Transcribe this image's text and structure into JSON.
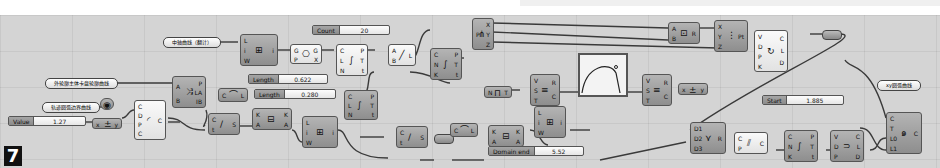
{
  "figure_number": "7",
  "panels": {
    "mid_curve": "中轴曲线（翻计）",
    "outer_curve": "外轮廓主体卡盘轮廓曲线",
    "boundary_curve": "轨迹圆弧边界曲线",
    "output_curve": "xy圆弧曲线"
  },
  "sliders": {
    "value": {
      "label": "Value",
      "value": "1.27"
    },
    "count": {
      "label": "Count",
      "value": "20"
    },
    "length1": {
      "label": "Length",
      "value": "0.622"
    },
    "length2": {
      "label": "Length",
      "value": "0.280"
    },
    "domain_end": {
      "label": "Domain end",
      "value": "5.52"
    },
    "start": {
      "label": "Start",
      "value": "1.885"
    }
  },
  "graph_mapper": {
    "label": "0.0.1",
    "corner": "0.0.1"
  },
  "nodes": [
    {
      "id": "merge",
      "inputs": [
        "C",
        "D",
        "P",
        "C"
      ],
      "outputs": [
        "C"
      ],
      "icon": "arc-icon"
    },
    {
      "id": "negate",
      "inputs": [
        "x"
      ],
      "outputs": [
        "y"
      ],
      "icon": "negate-icon"
    },
    {
      "id": "circle-param",
      "inputs": [],
      "outputs": [],
      "icon": "circle-icon"
    },
    {
      "id": "evaluate-angle",
      "inputs": [
        "A",
        "B"
      ],
      "outputs": [
        "P",
        "LA",
        "IB"
      ],
      "icon": "split-icon"
    },
    {
      "id": "shift-list",
      "inputs": [
        "L",
        "i",
        "W"
      ],
      "outputs": [
        "i"
      ],
      "icon": "list-item-icon"
    },
    {
      "id": "curve-closest",
      "inputs": [
        "G",
        "P"
      ],
      "outputs": [
        "G",
        "X"
      ],
      "icon": "geometry-icon"
    },
    {
      "id": "divide-curve-1",
      "inputs": [
        "C",
        "L",
        "N"
      ],
      "outputs": [
        "P",
        "T",
        "t"
      ],
      "icon": "divide-icon"
    },
    {
      "id": "line",
      "inputs": [
        "A",
        "B"
      ],
      "outputs": [
        "L"
      ],
      "icon": "line-icon"
    },
    {
      "id": "divide-curve-2",
      "inputs": [
        "C",
        "N",
        "K"
      ],
      "outputs": [
        "P",
        "T",
        "t"
      ],
      "icon": "divide-icon"
    },
    {
      "id": "deconstruct",
      "inputs": [
        "P"
      ],
      "outputs": [
        "X",
        "Y",
        "Z"
      ],
      "icon": "deconstruct-icon"
    },
    {
      "id": "length",
      "inputs": [
        "C"
      ],
      "outputs": [
        "L"
      ],
      "icon": "length-icon"
    },
    {
      "id": "sub-curve",
      "inputs": [
        "C",
        "t"
      ],
      "outputs": [
        "S"
      ],
      "icon": "subcurve-icon"
    },
    {
      "id": "reparam",
      "inputs": [
        "K",
        "A"
      ],
      "outputs": [
        "K",
        "A"
      ],
      "icon": "reparam-icon"
    },
    {
      "id": "list-item-2",
      "inputs": [
        "L",
        "i",
        "W"
      ],
      "outputs": [
        "i"
      ],
      "icon": "list-item-icon"
    },
    {
      "id": "divide-curve-3",
      "inputs": [
        "C",
        "L",
        "N"
      ],
      "outputs": [
        "P",
        "T",
        "t"
      ],
      "icon": "divide-icon"
    },
    {
      "id": "sub-curve-2",
      "inputs": [
        "C",
        "t"
      ],
      "outputs": [
        "S"
      ],
      "icon": "subcurve-icon"
    },
    {
      "id": "remap-1",
      "inputs": [
        "V",
        "S",
        "T"
      ],
      "outputs": [
        "R",
        "C"
      ],
      "icon": "remap-icon"
    },
    {
      "id": "range",
      "inputs": [
        "N"
      ],
      "outputs": [
        "T"
      ],
      "icon": "range-icon"
    },
    {
      "id": "multiply",
      "inputs": [
        "A",
        "B"
      ],
      "outputs": [
        "R"
      ],
      "icon": "multiply-icon"
    },
    {
      "id": "construct-point",
      "inputs": [
        "X",
        "Y",
        "Z"
      ],
      "outputs": [
        "Pt"
      ],
      "icon": "point-icon"
    },
    {
      "id": "polyline",
      "inputs": [
        "V",
        "D",
        "P",
        "K"
      ],
      "outputs": [
        "C",
        "L",
        "D"
      ],
      "icon": "interp-icon"
    },
    {
      "id": "remap-2",
      "inputs": [
        "V",
        "S",
        "T"
      ],
      "outputs": [
        "R",
        "C"
      ],
      "icon": "remap-icon"
    },
    {
      "id": "negate-2",
      "inputs": [
        "x"
      ],
      "outputs": [
        "y"
      ],
      "icon": "negate-icon"
    },
    {
      "id": "construct-domain",
      "inputs": [
        "A",
        "B"
      ],
      "outputs": [
        "I"
      ],
      "icon": "domain-icon"
    },
    {
      "id": "list-item-3",
      "inputs": [
        "L",
        "i",
        "W"
      ],
      "outputs": [
        "i"
      ],
      "icon": "list-item-icon"
    },
    {
      "id": "length-2",
      "inputs": [
        "C"
      ],
      "outputs": [
        "L"
      ],
      "icon": "length-icon"
    },
    {
      "id": "reparam-2",
      "inputs": [
        "K",
        "A"
      ],
      "outputs": [
        "K",
        "A"
      ],
      "icon": "reparam-icon"
    },
    {
      "id": "merge-d",
      "inputs": [
        "D1",
        "D2",
        "D3"
      ],
      "outputs": [
        "R"
      ],
      "icon": "merge-icon"
    },
    {
      "id": "curve-c",
      "inputs": [
        "C",
        "P"
      ],
      "outputs": [
        "C"
      ],
      "icon": "curve-icon"
    },
    {
      "id": "divide-curve-4",
      "inputs": [
        "C",
        "N",
        "K"
      ],
      "outputs": [
        "P",
        "T",
        "t"
      ],
      "icon": "divide-icon"
    },
    {
      "id": "interp",
      "inputs": [
        "V",
        "D",
        "P"
      ],
      "outputs": [
        "C",
        "L",
        "D"
      ],
      "icon": "interp-curve-icon"
    },
    {
      "id": "arc-blend",
      "inputs": [
        "C",
        "T",
        "L0",
        "L1"
      ],
      "outputs": [
        "C"
      ],
      "icon": "spiral-icon"
    }
  ]
}
